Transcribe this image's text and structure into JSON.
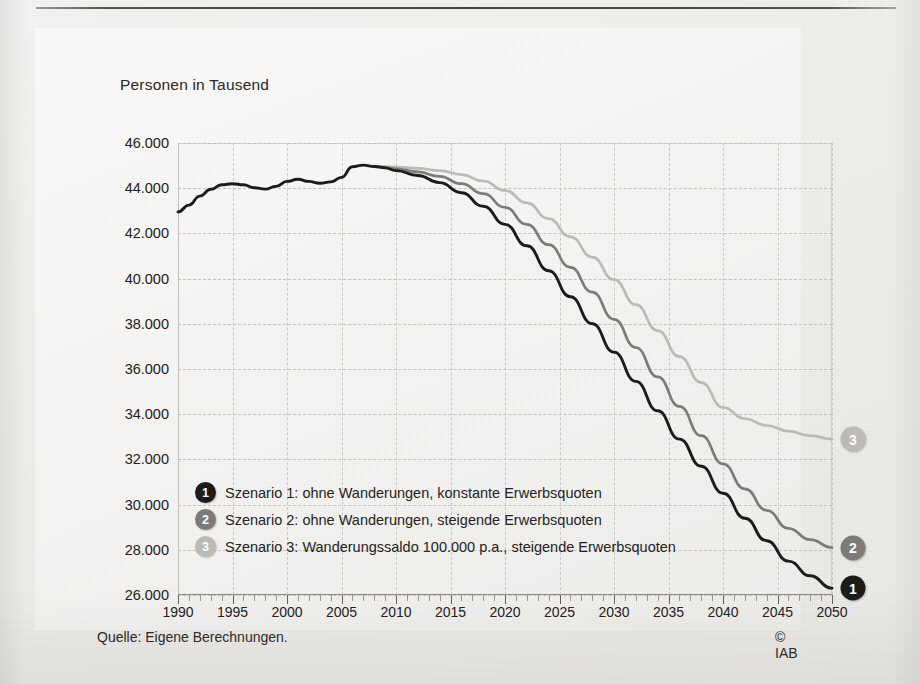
{
  "figure": {
    "axis_title": "Personen in Tausend",
    "source_note": "Quelle: Eigene Berechnungen.",
    "copyright": "© IAB"
  },
  "chart_data": {
    "type": "line",
    "title": "",
    "subtitle": "",
    "xlabel": "",
    "ylabel": "Personen in Tausend",
    "xlim": [
      1990,
      2050
    ],
    "ylim": [
      26000,
      46000
    ],
    "ytick_step": 2000,
    "grid": true,
    "legend_position": "inside-lower-left",
    "x_major_ticks": [
      1990,
      1995,
      2000,
      2005,
      2010,
      2015,
      2020,
      2025,
      2030,
      2035,
      2040,
      2045,
      2050
    ],
    "x_minor_tick_interval": 1,
    "y_ticks": [
      26000,
      28000,
      30000,
      32000,
      34000,
      36000,
      38000,
      40000,
      42000,
      44000,
      46000
    ],
    "y_tick_labels": [
      "26.000",
      "28.000",
      "30.000",
      "32.000",
      "34.000",
      "36.000",
      "38.000",
      "40.000",
      "42.000",
      "44.000",
      "46.000"
    ],
    "x_tick_labels": [
      "1990",
      "1995",
      "2000",
      "2005",
      "2010",
      "2015",
      "2020",
      "2025",
      "2030",
      "2035",
      "2040",
      "2045",
      "2050"
    ],
    "colors": {
      "scenario_1": "#1b1b1b",
      "scenario_2": "#7d7b78",
      "scenario_3": "#bcbab6"
    },
    "series": [
      {
        "name": "Szenario 1: ohne Wanderungen, konstante Erwerbsquoten",
        "badge": "1",
        "color": "#1b1b1b",
        "x": [
          1990,
          1991,
          1992,
          1993,
          1994,
          1995,
          1996,
          1997,
          1998,
          1999,
          2000,
          2001,
          2002,
          2003,
          2004,
          2005,
          2006,
          2007,
          2008,
          2009,
          2010,
          2012,
          2014,
          2016,
          2018,
          2020,
          2022,
          2024,
          2026,
          2028,
          2030,
          2032,
          2034,
          2036,
          2038,
          2040,
          2042,
          2044,
          2046,
          2048,
          2050
        ],
        "values": [
          42950,
          43250,
          43650,
          43950,
          44150,
          44200,
          44150,
          44020,
          43960,
          44080,
          44300,
          44400,
          44300,
          44220,
          44280,
          44480,
          44950,
          45020,
          44960,
          44900,
          44780,
          44560,
          44250,
          43800,
          43200,
          42400,
          41450,
          40350,
          39200,
          38000,
          36750,
          35450,
          34150,
          32900,
          31700,
          30500,
          29400,
          28400,
          27500,
          26850,
          26300
        ]
      },
      {
        "name": "Szenario 2: ohne Wanderungen, steigende Erwerbsquoten",
        "badge": "2",
        "color": "#7d7b78",
        "x": [
          2008,
          2009,
          2010,
          2012,
          2014,
          2016,
          2018,
          2020,
          2022,
          2024,
          2026,
          2028,
          2030,
          2032,
          2034,
          2036,
          2038,
          2040,
          2042,
          2044,
          2046,
          2048,
          2050
        ],
        "values": [
          44960,
          44920,
          44860,
          44720,
          44520,
          44200,
          43760,
          43150,
          42400,
          41500,
          40500,
          39400,
          38200,
          36950,
          35650,
          34350,
          33050,
          31800,
          30700,
          29750,
          28950,
          28450,
          28100
        ]
      },
      {
        "name": "Szenario 3: Wanderungssaldo 100.000 p.a., steigende Erwerbsquoten",
        "badge": "3",
        "color": "#bcbab6",
        "x": [
          2008,
          2009,
          2010,
          2012,
          2014,
          2016,
          2018,
          2020,
          2022,
          2024,
          2026,
          2028,
          2030,
          2032,
          2034,
          2036,
          2038,
          2040,
          2042,
          2044,
          2046,
          2048,
          2050
        ],
        "values": [
          44980,
          44960,
          44940,
          44880,
          44780,
          44600,
          44320,
          43900,
          43350,
          42650,
          41850,
          40950,
          39950,
          38850,
          37700,
          36550,
          35400,
          34300,
          33800,
          33500,
          33250,
          33050,
          32900
        ]
      }
    ],
    "end_markers": [
      {
        "label": "3",
        "year": 2050,
        "value": 32900,
        "color": "#bcbab6"
      },
      {
        "label": "2",
        "year": 2050,
        "value": 28100,
        "color": "#7d7b78"
      },
      {
        "label": "1",
        "year": 2050,
        "value": 26300,
        "color": "#1b1b1b"
      }
    ],
    "annotations": []
  },
  "legend": {
    "items": [
      {
        "badge": "1",
        "color": "#1b1b1b",
        "label": "Szenario 1: ohne Wanderungen, konstante Erwerbsquoten"
      },
      {
        "badge": "2",
        "color": "#7d7b78",
        "label": "Szenario 2: ohne Wanderungen, steigende Erwerbsquoten"
      },
      {
        "badge": "3",
        "color": "#bcbab6",
        "label": "Szenario 3: Wanderungssaldo 100.000 p.a., steigende Erwerbsquoten"
      }
    ]
  }
}
